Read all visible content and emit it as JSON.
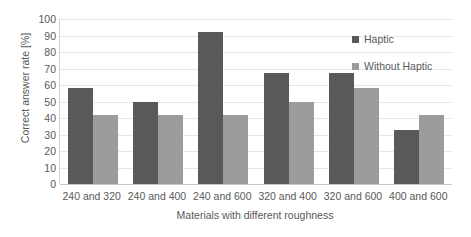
{
  "chart_data": {
    "type": "bar",
    "title": "",
    "xlabel": "Materials with different roughness",
    "ylabel": "Correct answer rate [%]",
    "categories": [
      "240 and 320",
      "240 and 400",
      "240 and 600",
      "320 and 400",
      "320 and 600",
      "400 and 600"
    ],
    "series": [
      {
        "name": "Haptic",
        "color": "#595959",
        "values": [
          58,
          50,
          92,
          67,
          67,
          33
        ]
      },
      {
        "name": "Without Haptic",
        "color": "#9c9c9c",
        "values": [
          42,
          42,
          42,
          50,
          58,
          42
        ]
      }
    ],
    "ylim": [
      0,
      100
    ],
    "ytick_step": 10,
    "yticks": [
      100,
      90,
      80,
      70,
      60,
      50,
      40,
      30,
      20,
      10,
      0
    ],
    "grid": true,
    "legend_position": "inside-top-right",
    "text_color": "#595959",
    "gridline_color": "#e6e6e6",
    "background": "#ffffff"
  }
}
